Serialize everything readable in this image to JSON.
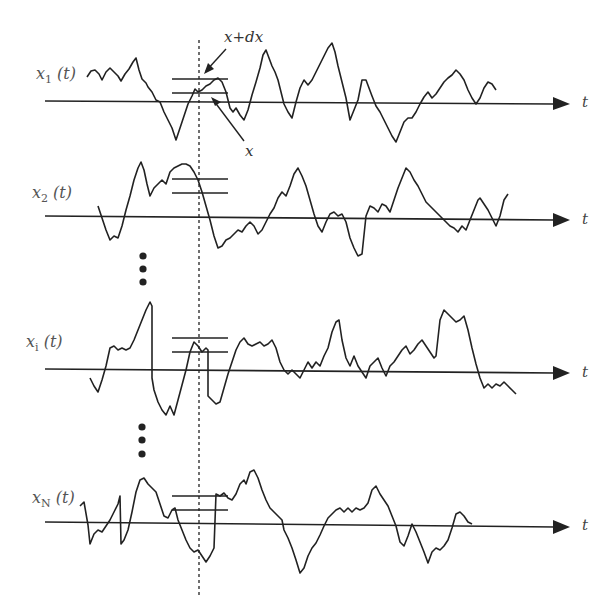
{
  "figure": {
    "signals": [
      {
        "label_main": "x",
        "label_sub": "1",
        "label_arg": " (t)",
        "axis_label": "t"
      },
      {
        "label_main": "x",
        "label_sub": "2",
        "label_arg": " (t)",
        "axis_label": "t"
      },
      {
        "label_main": "x",
        "label_sub": "i",
        "label_arg": " (t)",
        "axis_label": "t"
      },
      {
        "label_main": "x",
        "label_sub": "N",
        "label_arg": " (t)",
        "axis_label": "t"
      }
    ],
    "annotations": {
      "upper_level": "x+dx",
      "lower_level": "x"
    },
    "ellipsis": "⋮"
  }
}
